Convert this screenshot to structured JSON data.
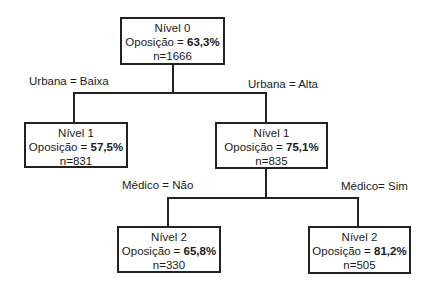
{
  "diagram": {
    "type": "decision-tree",
    "nodes": [
      {
        "id": "root",
        "level_label": "Nível 0",
        "metric_label": "Oposição = ",
        "metric_value": "63,3%",
        "n_label": "n=1666"
      },
      {
        "id": "urbana-baixa",
        "level_label": "Nível 1",
        "metric_label": "Oposição = ",
        "metric_value": "57,5%",
        "n_label": "n=831"
      },
      {
        "id": "urbana-alta",
        "level_label": "Nível 1",
        "metric_label": "Oposição = ",
        "metric_value": "75,1%",
        "n_label": "n=835"
      },
      {
        "id": "medico-nao",
        "level_label": "Nível 2",
        "metric_label": "Oposição = ",
        "metric_value": "65,8%",
        "n_label": "n=330"
      },
      {
        "id": "medico-sim",
        "level_label": "Nível 2",
        "metric_label": "Oposição = ",
        "metric_value": "81,2%",
        "n_label": "n=505"
      }
    ],
    "edges": [
      {
        "from": "root",
        "to": "urbana-baixa",
        "label": "Urbana = Baixa"
      },
      {
        "from": "root",
        "to": "urbana-alta",
        "label": "Urbana = Alta"
      },
      {
        "from": "urbana-alta",
        "to": "medico-nao",
        "label": "Médico = Não"
      },
      {
        "from": "urbana-alta",
        "to": "medico-sim",
        "label": "Médico= Sim"
      }
    ]
  },
  "colors": {
    "line": "#222222",
    "background": "#ffffff",
    "text": "#1a1a1a"
  }
}
